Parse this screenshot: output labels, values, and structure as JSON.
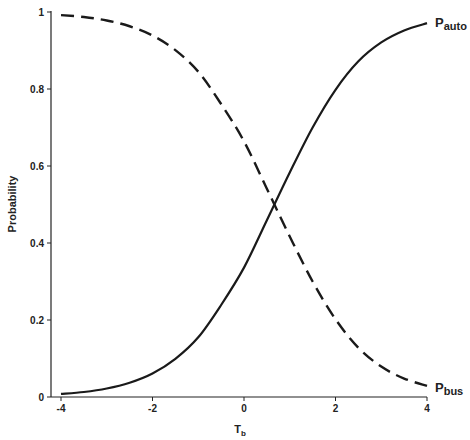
{
  "chart_data": {
    "type": "line",
    "title": "",
    "xlabel": "T",
    "xlabel_subscript": "b",
    "ylabel": "Probability",
    "xlim": [
      -4,
      4
    ],
    "ylim": [
      0,
      1
    ],
    "x_ticks": [
      -4,
      -2,
      0,
      2,
      4
    ],
    "x_tick_labels": [
      "-4",
      "-2",
      "0",
      "2",
      "4"
    ],
    "y_ticks": [
      0,
      0.2,
      0.4,
      0.6,
      0.8,
      1
    ],
    "y_tick_labels": [
      "0",
      "0.2",
      "0.4",
      "0.6",
      "0.8",
      "1"
    ],
    "grid": false,
    "legend": "inline labels at right end of curves",
    "x": [
      -4,
      -3.5,
      -3,
      -2.5,
      -2,
      -1.5,
      -1,
      -0.5,
      0,
      0.5,
      1,
      1.5,
      2,
      2.5,
      3,
      3.5,
      4
    ],
    "series": [
      {
        "name": "P_auto",
        "label_main": "P",
        "label_sub": "auto",
        "style": "solid",
        "values": [
          0.008,
          0.013,
          0.022,
          0.037,
          0.061,
          0.099,
          0.155,
          0.239,
          0.336,
          0.459,
          0.583,
          0.7,
          0.798,
          0.872,
          0.921,
          0.952,
          0.971
        ]
      },
      {
        "name": "P_bus",
        "label_main": "P",
        "label_sub": "bus",
        "style": "dashed",
        "values": [
          0.992,
          0.987,
          0.978,
          0.963,
          0.939,
          0.901,
          0.845,
          0.761,
          0.664,
          0.541,
          0.417,
          0.3,
          0.202,
          0.128,
          0.079,
          0.048,
          0.029
        ]
      }
    ],
    "annotations": [
      "Curves cross near T_b ≈ 0.65, probability ≈ 0.5"
    ]
  },
  "header": {
    "cut_off_caption": "(caption text cut off at top edge, illegible)"
  }
}
